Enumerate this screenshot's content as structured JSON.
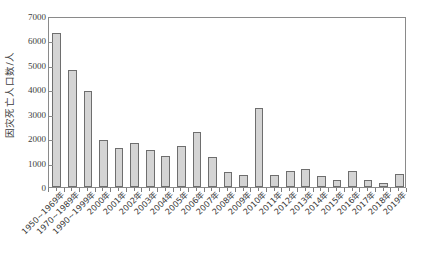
{
  "chart_data": {
    "type": "bar",
    "title": "",
    "subtitle": "",
    "xlabel": "",
    "ylabel": "因灾死亡人口数/人",
    "ylim": [
      0,
      7000
    ],
    "ytick_values": [
      0,
      1000,
      2000,
      3000,
      4000,
      5000,
      6000,
      7000
    ],
    "ytick_labels": [
      "0",
      "1000",
      "2000",
      "3000",
      "4000",
      "5000",
      "6000",
      "7000"
    ],
    "grid": false,
    "legend": null,
    "legend_position": "none",
    "bar_fill_color": "#d4d4d4",
    "bar_edge_color": "#6e6e6e",
    "axis_color": "#8a8a8a",
    "categories": [
      "1950~1969年",
      "1970~1989年",
      "1990~1999年",
      "2000年",
      "2001年",
      "2002年",
      "2003年",
      "2004年",
      "2005年",
      "2006年",
      "2007年",
      "2008年",
      "2009年",
      "2010年",
      "2011年",
      "2012年",
      "2013年",
      "2014年",
      "2015年",
      "2016年",
      "2017年",
      "2018年",
      "2019年"
    ],
    "values": [
      6300,
      4770,
      3930,
      1940,
      1590,
      1810,
      1530,
      1270,
      1670,
      2270,
      1220,
      620,
      510,
      3220,
      490,
      650,
      750,
      460,
      280,
      660,
      270,
      170,
      530
    ]
  }
}
